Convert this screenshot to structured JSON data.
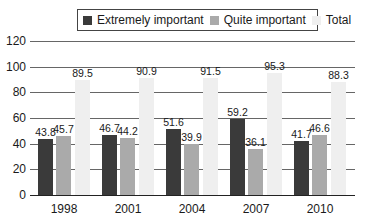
{
  "chart_data": {
    "type": "bar",
    "title": "",
    "xlabel": "",
    "ylabel": "",
    "categories": [
      "1998",
      "2001",
      "2004",
      "2007",
      "2010"
    ],
    "series": [
      {
        "name": "Extremely important",
        "color": "#3a3a3a",
        "values": [
          43.8,
          46.7,
          51.6,
          59.2,
          41.7
        ]
      },
      {
        "name": "Quite important",
        "color": "#aaaaaa",
        "values": [
          45.7,
          44.2,
          39.9,
          36.1,
          46.6
        ]
      },
      {
        "name": "Total",
        "color": "#efefef",
        "values": [
          89.5,
          90.9,
          91.5,
          95.3,
          88.3
        ]
      }
    ],
    "ylim": [
      0,
      120
    ],
    "yticks": [
      0,
      20,
      40,
      60,
      80,
      100,
      120
    ],
    "grid": true,
    "legend_position": "top"
  },
  "legend": {
    "items": [
      {
        "label": "Extremely important",
        "color": "#3a3a3a"
      },
      {
        "label": "Quite important",
        "color": "#aaaaaa"
      },
      {
        "label": "Total",
        "color": "#efefef"
      }
    ]
  }
}
